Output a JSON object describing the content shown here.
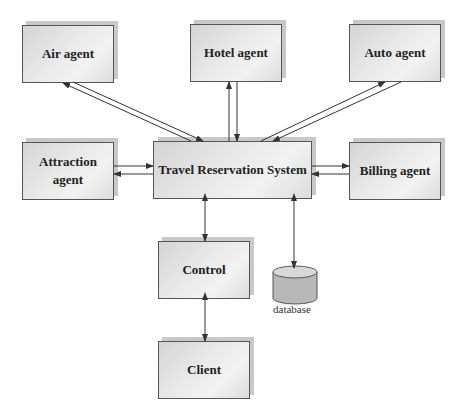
{
  "diagram": {
    "nodes": {
      "air": {
        "label": "Air agent"
      },
      "hotel": {
        "label": "Hotel agent"
      },
      "auto": {
        "label": "Auto agent"
      },
      "attraction": {
        "label": "Attraction\nagent",
        "line1": "Attraction",
        "line2": "agent"
      },
      "trs": {
        "label": "Travel Reservation System"
      },
      "billing": {
        "label": "Billing agent"
      },
      "control": {
        "label": "Control"
      },
      "client": {
        "label": "Client"
      },
      "database": {
        "label": "database"
      }
    },
    "edges": [
      {
        "from": "trs",
        "to": "air"
      },
      {
        "from": "air",
        "to": "trs"
      },
      {
        "from": "trs",
        "to": "hotel"
      },
      {
        "from": "hotel",
        "to": "trs"
      },
      {
        "from": "trs",
        "to": "auto"
      },
      {
        "from": "auto",
        "to": "trs"
      },
      {
        "from": "attraction",
        "to": "trs"
      },
      {
        "from": "trs",
        "to": "attraction"
      },
      {
        "from": "trs",
        "to": "billing"
      },
      {
        "from": "billing",
        "to": "trs"
      },
      {
        "from": "trs",
        "to": "control",
        "bidirectional": true
      },
      {
        "from": "trs",
        "to": "database",
        "bidirectional": true
      },
      {
        "from": "control",
        "to": "client",
        "bidirectional": true
      }
    ],
    "colors": {
      "box_fill": "#e6e6e6",
      "box_border": "#555555",
      "shadow": "#c8c8c8",
      "line": "#333333",
      "database_fill": "#bdbdbd"
    }
  }
}
